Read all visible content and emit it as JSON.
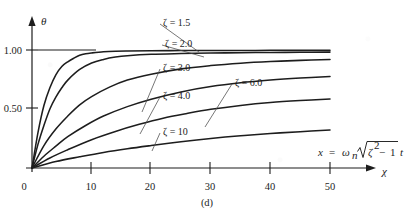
{
  "figure": {
    "caption": "(d)",
    "y_axis_symbol": "θ",
    "x_axis_symbol": "χ",
    "equation": {
      "lhs": "x",
      "equals": "=",
      "omega": "ω",
      "omega_sub": "n",
      "radicand_zeta": "ζ",
      "radicand_exp": "2",
      "minus": "−",
      "radicand_one": "1",
      "trailing": "t",
      "plain": "x = ωn√(ζ² − 1) t"
    }
  },
  "chart_data": {
    "type": "line",
    "title": "(d)",
    "xlabel": "χ",
    "ylabel": "θ",
    "xlim": [
      0,
      56
    ],
    "ylim": [
      0,
      1.12
    ],
    "xticks": [
      0,
      10,
      20,
      30,
      40,
      50
    ],
    "xtick_labels": [
      "0",
      "10",
      "20",
      "30",
      "40",
      "50"
    ],
    "yticks": [
      0.5,
      1.0
    ],
    "ytick_labels": [
      "0.50",
      "1.00"
    ],
    "grid": false,
    "legend_position": "inline-annotations",
    "annotations": [
      {
        "text": "x = ωn√(ζ² − 1) t",
        "x": 43.0,
        "y": 0.21
      }
    ],
    "series": [
      {
        "name": "ζ = 1.5",
        "label": "ζ = 1.5",
        "zeta": 1.5,
        "x": [
          0,
          1,
          2,
          3,
          4,
          5,
          6,
          7,
          8,
          9,
          10,
          12,
          14,
          16,
          20,
          25,
          30,
          35,
          40,
          45,
          50
        ],
        "values": [
          0.0,
          0.3,
          0.53,
          0.68,
          0.79,
          0.86,
          0.9,
          0.93,
          0.955,
          0.968,
          0.975,
          0.985,
          0.99,
          0.992,
          0.994,
          0.995,
          0.996,
          0.996,
          0.997,
          0.997,
          0.997
        ]
      },
      {
        "name": "ζ = 2.0",
        "label": "ζ = 2.0",
        "zeta": 2.0,
        "x": [
          0,
          1,
          2,
          3,
          4,
          5,
          6,
          8,
          10,
          12,
          14,
          16,
          20,
          25,
          30,
          35,
          40,
          45,
          50
        ],
        "values": [
          0.0,
          0.2,
          0.36,
          0.5,
          0.6,
          0.68,
          0.745,
          0.835,
          0.89,
          0.92,
          0.94,
          0.952,
          0.964,
          0.97,
          0.974,
          0.977,
          0.979,
          0.981,
          0.982
        ]
      },
      {
        "name": "ζ = 3.0",
        "label": "ζ = 3.0",
        "zeta": 3.0,
        "x": [
          0,
          2,
          4,
          6,
          8,
          10,
          13,
          16,
          20,
          25,
          30,
          35,
          40,
          45,
          50
        ],
        "values": [
          0.0,
          0.19,
          0.33,
          0.44,
          0.535,
          0.605,
          0.685,
          0.745,
          0.795,
          0.84,
          0.868,
          0.888,
          0.902,
          0.912,
          0.92
        ]
      },
      {
        "name": "ζ = 4.0",
        "label": "ζ = 4.0",
        "zeta": 4.0,
        "x": [
          0,
          2,
          4,
          6,
          9,
          12,
          16,
          20,
          25,
          30,
          35,
          40,
          45,
          50
        ],
        "values": [
          0.0,
          0.1,
          0.185,
          0.265,
          0.36,
          0.44,
          0.52,
          0.583,
          0.645,
          0.69,
          0.722,
          0.745,
          0.762,
          0.775
        ]
      },
      {
        "name": "ζ = 6.0",
        "label": "ζ = 6.0",
        "zeta": 6.0,
        "x": [
          0,
          3,
          6,
          10,
          14,
          18,
          22,
          26,
          30,
          35,
          40,
          45,
          50
        ],
        "values": [
          0.0,
          0.085,
          0.155,
          0.24,
          0.31,
          0.37,
          0.422,
          0.462,
          0.497,
          0.53,
          0.555,
          0.572,
          0.585
        ]
      },
      {
        "name": "ζ = 10",
        "label": "ζ = 10",
        "zeta": 10,
        "x": [
          0,
          4,
          8,
          12,
          16,
          20,
          25,
          30,
          35,
          40,
          45,
          50
        ],
        "values": [
          0.0,
          0.055,
          0.095,
          0.132,
          0.163,
          0.19,
          0.222,
          0.25,
          0.273,
          0.292,
          0.308,
          0.322
        ]
      }
    ],
    "curve_labels": [
      {
        "text": "ζ = 1.5",
        "label_x": 163,
        "label_y": 22,
        "leader_to_x": 199,
        "leader_to_y": 52
      },
      {
        "text": "ζ = 2.0",
        "label_x": 165,
        "label_y": 43,
        "leader_to_x": 204,
        "leader_to_y": 57
      },
      {
        "text": "ζ = 3.0",
        "label_x": 163,
        "label_y": 67,
        "leader_to_x": 142,
        "leader_to_y": 112
      },
      {
        "text": "ζ = 4.0",
        "label_x": 163,
        "label_y": 95,
        "leader_to_x": 140,
        "leader_to_y": 134
      },
      {
        "text": "ζ = 6.0",
        "label_x": 235,
        "label_y": 82,
        "leader_to_x": 205,
        "leader_to_y": 127
      },
      {
        "text": "ζ = 10",
        "label_x": 163,
        "label_y": 131,
        "leader_to_x": 152,
        "leader_to_y": 151
      }
    ]
  }
}
